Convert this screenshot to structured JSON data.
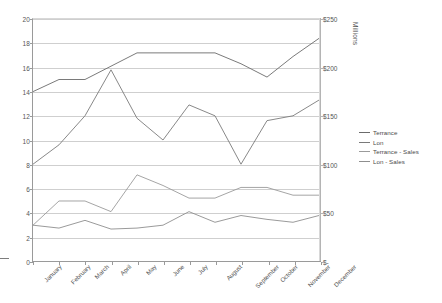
{
  "chart_data": {
    "type": "line",
    "title": "",
    "subtitle": "",
    "xlabel": "",
    "ylabel": "",
    "ylabel_right": "Millions",
    "grid": true,
    "legend_position": "right",
    "categories": [
      "January",
      "February",
      "March",
      "April",
      "May",
      "June",
      "July",
      "August",
      "September",
      "October",
      "November",
      "December"
    ],
    "axes": {
      "left": {
        "min": 0,
        "max": 20,
        "step": 2,
        "ticks": [
          "0",
          "2",
          "4",
          "6",
          "8",
          "10",
          "12",
          "14",
          "16",
          "18",
          "20"
        ]
      },
      "right": {
        "min": 0,
        "max": 250,
        "step": 50,
        "ticks": [
          "$-",
          "$50",
          "$100",
          "$150",
          "$200",
          "$250"
        ],
        "title": "Millions"
      }
    },
    "series": [
      {
        "name": "Terrance",
        "axis": "left",
        "color": "#6b6b6b",
        "values": [
          14.0,
          15.0,
          15.0,
          16.1,
          17.2,
          17.2,
          17.2,
          17.2,
          16.3,
          15.2,
          16.9,
          18.4
        ]
      },
      {
        "name": "Lon",
        "axis": "left",
        "color": "#7a7a7a",
        "values": [
          8.0,
          9.6,
          12.0,
          15.8,
          11.8,
          10.0,
          12.9,
          12.0,
          8.0,
          11.6,
          12.0,
          13.3
        ]
      },
      {
        "name": "Terrance - Sales",
        "axis": "right",
        "color": "#9b9b9b",
        "values": [
          37,
          62,
          62,
          51,
          89,
          78,
          65,
          65,
          76,
          76,
          68,
          68
        ]
      },
      {
        "name": "Lon - Sales",
        "axis": "right",
        "color": "#8f8f8f",
        "values": [
          37,
          34,
          42,
          33,
          34,
          37,
          51,
          40,
          47,
          43,
          40,
          47
        ]
      }
    ]
  },
  "legend": {
    "items": [
      {
        "label": "Terrance",
        "color": "#6b6b6b"
      },
      {
        "label": "Lon",
        "color": "#7a7a7a"
      },
      {
        "label": "Terrance - Sales",
        "color": "#9b9b9b"
      },
      {
        "label": "Lon - Sales",
        "color": "#8f8f8f"
      }
    ]
  }
}
